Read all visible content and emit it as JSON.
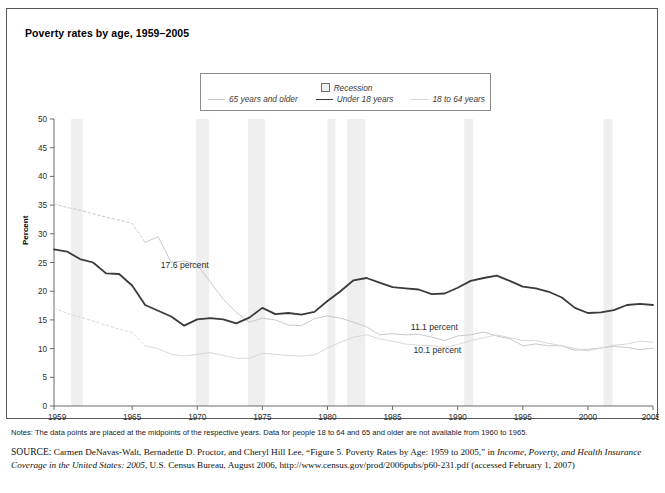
{
  "figure": {
    "title": "Poverty rates by age, 1959–2005",
    "ylabel": "Percent"
  },
  "legend": {
    "recession_label": "Recession",
    "recession_swatch": "recession-box-icon",
    "items": [
      {
        "label": "65 years and older",
        "color": "#c9c9c9",
        "style": "solid-light"
      },
      {
        "label": "Under 18 years",
        "color": "#3a3a3a",
        "style": "solid-dark"
      },
      {
        "label": "18 to 64 years",
        "color": "#d8d8d8",
        "style": "solid-lighter"
      }
    ]
  },
  "annotations": [
    {
      "text": "17.6 percent",
      "x": 1967.2,
      "y": 24.0
    },
    {
      "text": "11.1 percent",
      "x": 1986.4,
      "y": 13.2
    },
    {
      "text": "10.1 percent",
      "x": 1986.6,
      "y": 9.3
    }
  ],
  "notes": {
    "prefix": "Notes:",
    "text": " The data points are placed at the midpoints of the respective years. Data for people 18 to 64 and 65 and older are not available from 1960 to 1965."
  },
  "source": {
    "label": "SOURCE:",
    "part1": " Carmen DeNavas-Walt, Bernadette D. Proctor, and Cheryl Hill Lee, “Figure 5. Poverty Rates by Age: 1959 to 2005,” in ",
    "italic1": "Income, Poverty, and Health Insurance Coverage in the United States: 2005",
    "part2": ", U.S. Census Bureau, August 2006, http://www.census.gov/prod/2006pubs/p60-231.pdf (accessed February 1, 2007)"
  },
  "chart_data": {
    "type": "line",
    "title": "Poverty rates by age, 1959–2005",
    "xlabel": "",
    "ylabel": "Percent",
    "xlim": [
      1959,
      2005
    ],
    "ylim": [
      0,
      50
    ],
    "ytick_step": 5,
    "yticks": [
      0,
      5,
      10,
      15,
      20,
      25,
      30,
      35,
      40,
      45,
      50
    ],
    "xticks": [
      1959,
      1965,
      1970,
      1975,
      1980,
      1985,
      1990,
      1995,
      2000,
      2005
    ],
    "grid": false,
    "legend_position": "top-center",
    "recessions": [
      {
        "start": 1960.3,
        "end": 1961.2
      },
      {
        "start": 1969.9,
        "end": 1970.9
      },
      {
        "start": 1973.9,
        "end": 1975.2
      },
      {
        "start": 1980.0,
        "end": 1980.6
      },
      {
        "start": 1981.5,
        "end": 1982.9
      },
      {
        "start": 1990.5,
        "end": 1991.2
      },
      {
        "start": 2001.2,
        "end": 2001.9
      }
    ],
    "series": [
      {
        "name": "65 years and older",
        "color": "#c9c9c9",
        "dashed_range": [
          1959,
          1966
        ],
        "x": [
          1959,
          1960,
          1961,
          1962,
          1963,
          1964,
          1965,
          1966,
          1967,
          1968,
          1969,
          1970,
          1971,
          1972,
          1973,
          1974,
          1975,
          1976,
          1977,
          1978,
          1979,
          1980,
          1981,
          1982,
          1983,
          1984,
          1985,
          1986,
          1987,
          1988,
          1989,
          1990,
          1991,
          1992,
          1993,
          1994,
          1995,
          1996,
          1997,
          1998,
          1999,
          2000,
          2001,
          2002,
          2003,
          2004,
          2005
        ],
        "values": [
          35.2,
          34.6,
          34.1,
          33.5,
          32.9,
          32.4,
          31.8,
          28.5,
          29.5,
          25.0,
          25.3,
          24.6,
          21.6,
          18.6,
          16.3,
          14.6,
          15.3,
          15.0,
          14.1,
          14.0,
          15.2,
          15.7,
          15.3,
          14.6,
          13.8,
          12.4,
          12.6,
          12.4,
          12.5,
          12.0,
          11.4,
          12.2,
          12.4,
          12.9,
          12.2,
          11.7,
          10.5,
          10.8,
          10.5,
          10.5,
          9.7,
          9.9,
          10.1,
          10.4,
          10.2,
          9.8,
          10.1
        ]
      },
      {
        "name": "Under 18 years",
        "color": "#3a3a3a",
        "dashed_range": null,
        "x": [
          1959,
          1960,
          1961,
          1962,
          1963,
          1964,
          1965,
          1966,
          1967,
          1968,
          1969,
          1970,
          1971,
          1972,
          1973,
          1974,
          1975,
          1976,
          1977,
          1978,
          1979,
          1980,
          1981,
          1982,
          1983,
          1984,
          1985,
          1986,
          1987,
          1988,
          1989,
          1990,
          1991,
          1992,
          1993,
          1994,
          1995,
          1996,
          1997,
          1998,
          1999,
          2000,
          2001,
          2002,
          2003,
          2004,
          2005
        ],
        "values": [
          27.3,
          26.9,
          25.6,
          25.0,
          23.1,
          23.0,
          21.0,
          17.6,
          16.6,
          15.6,
          14.0,
          15.1,
          15.3,
          15.1,
          14.4,
          15.4,
          17.1,
          16.0,
          16.2,
          15.9,
          16.4,
          18.3,
          20.0,
          21.9,
          22.3,
          21.5,
          20.7,
          20.5,
          20.3,
          19.5,
          19.6,
          20.6,
          21.8,
          22.3,
          22.7,
          21.8,
          20.8,
          20.5,
          19.9,
          18.9,
          17.1,
          16.2,
          16.3,
          16.7,
          17.6,
          17.8,
          17.6
        ]
      },
      {
        "name": "18 to 64 years",
        "color": "#d8d8d8",
        "dashed_range": [
          1959,
          1966
        ],
        "x": [
          1959,
          1960,
          1961,
          1962,
          1963,
          1964,
          1965,
          1966,
          1967,
          1968,
          1969,
          1970,
          1971,
          1972,
          1973,
          1974,
          1975,
          1976,
          1977,
          1978,
          1979,
          1980,
          1981,
          1982,
          1983,
          1984,
          1985,
          1986,
          1987,
          1988,
          1989,
          1990,
          1991,
          1992,
          1993,
          1994,
          1995,
          1996,
          1997,
          1998,
          1999,
          2000,
          2001,
          2002,
          2003,
          2004,
          2005
        ],
        "values": [
          17.0,
          16.2,
          15.5,
          14.8,
          14.1,
          13.4,
          12.8,
          10.5,
          10.0,
          9.0,
          8.7,
          9.0,
          9.3,
          8.8,
          8.3,
          8.3,
          9.2,
          9.0,
          8.8,
          8.7,
          8.9,
          10.1,
          11.1,
          12.0,
          12.4,
          11.7,
          11.3,
          10.8,
          10.6,
          10.5,
          10.2,
          10.7,
          11.4,
          11.9,
          12.4,
          11.9,
          11.4,
          11.4,
          10.9,
          10.5,
          10.0,
          9.6,
          10.1,
          10.6,
          10.8,
          11.3,
          11.1
        ]
      }
    ]
  }
}
